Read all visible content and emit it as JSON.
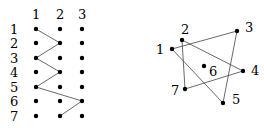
{
  "left_diagram": {
    "column_labels": [
      "1",
      "2",
      "3"
    ],
    "row_labels": [
      "1",
      "2",
      "3",
      "4",
      "5",
      "6",
      "7"
    ],
    "path": [
      [
        1,
        1
      ],
      [
        2,
        2
      ],
      [
        3,
        1
      ],
      [
        4,
        2
      ],
      [
        5,
        1
      ],
      [
        6,
        3
      ],
      [
        7,
        2
      ]
    ]
  },
  "right_diagram": {
    "nodes": [
      {
        "id": "1",
        "label": "1"
      },
      {
        "id": "2",
        "label": "2"
      },
      {
        "id": "3",
        "label": "3"
      },
      {
        "id": "4",
        "label": "4"
      },
      {
        "id": "5",
        "label": "5"
      },
      {
        "id": "6",
        "label": "6"
      },
      {
        "id": "7",
        "label": "7"
      }
    ],
    "edges": [
      [
        "1",
        "3"
      ],
      [
        "3",
        "5"
      ],
      [
        "5",
        "1"
      ],
      [
        "2",
        "4"
      ],
      [
        "4",
        "7"
      ],
      [
        "7",
        "2"
      ]
    ]
  }
}
